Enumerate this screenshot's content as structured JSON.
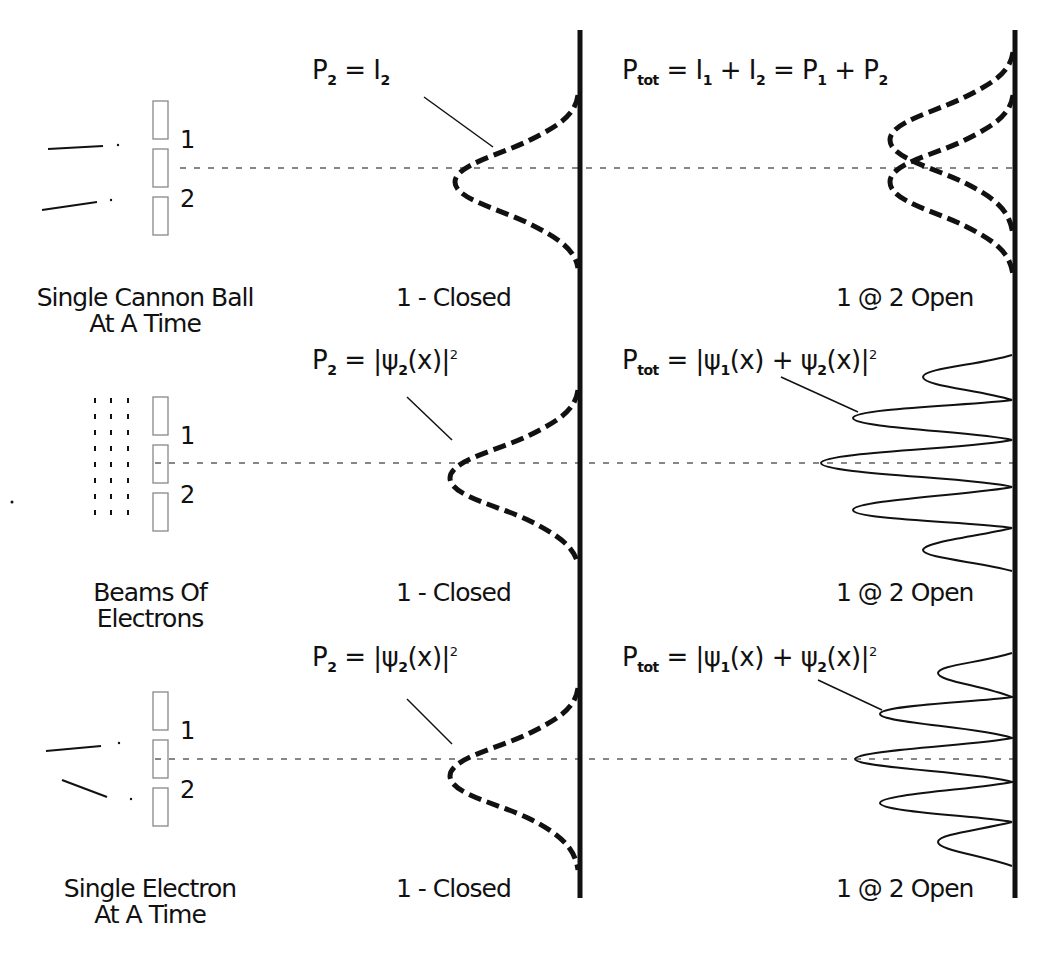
{
  "rows": [
    {
      "source_label_line1": "Single Cannon Ball",
      "source_label_line2": "At A Time",
      "slit1": "1",
      "slit2": "2",
      "closed_label": "1 - Closed",
      "closed_eq": {
        "lhs": "P",
        "lhs_sub": "2",
        "rhs": "= I",
        "rhs_sub": "2"
      },
      "open_label": "1 @ 2 Open",
      "open_eq": {
        "p": "P",
        "p_sub": "tot",
        "t1": "= I",
        "s1": "1",
        "t2": " + I",
        "s2": "2",
        "t3": " = P",
        "s3": "1",
        "t4": " + P",
        "s4": "2"
      }
    },
    {
      "source_label_line1": "Beams Of",
      "source_label_line2": "Electrons",
      "slit1": "1",
      "slit2": "2",
      "closed_label": "1 - Closed",
      "closed_eq": {
        "lhs": "P",
        "lhs_sub": "2",
        "a": "= |ψ",
        "a_sub": "2",
        "b": "(x)|",
        "b_sup": "2"
      },
      "open_label": "1 @ 2 Open",
      "open_eq": {
        "p": "P",
        "p_sub": "tot",
        "a": "= |ψ",
        "a_sub": "1",
        "b": "(x) + ψ",
        "b_sub": "2",
        "c": "(x)|",
        "c_sup": "2"
      }
    },
    {
      "source_label_line1": "Single Electron",
      "source_label_line2": "At A Time",
      "slit1": "1",
      "slit2": "2",
      "closed_label": "1 - Closed",
      "closed_eq": {
        "lhs": "P",
        "lhs_sub": "2",
        "a": "= |ψ",
        "a_sub": "2",
        "b": "(x)|",
        "b_sup": "2"
      },
      "open_label": "1 @ 2 Open",
      "open_eq": {
        "p": "P",
        "p_sub": "tot",
        "a": "= |ψ",
        "a_sub": "1",
        "b": "(x) + ψ",
        "b_sub": "2",
        "c": "(x)|",
        "c_sup": "2"
      }
    }
  ],
  "colors": {
    "ink": "#111111",
    "background": "#ffffff",
    "wall": "#888888"
  }
}
